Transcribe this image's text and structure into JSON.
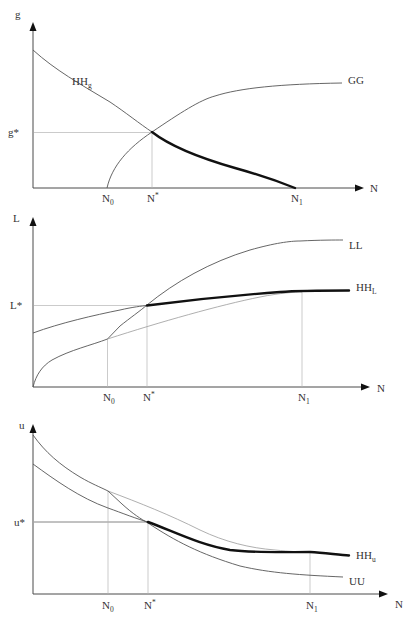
{
  "diagram": {
    "panels": [
      {
        "id": "top",
        "y_axis_label": "g",
        "x_axis_label": "N",
        "equilibrium_label": "g*",
        "curves": [
          {
            "name": "HH_g",
            "label_main": "HH",
            "label_sub": "g",
            "style": "thin then bold after N*"
          },
          {
            "name": "GG",
            "label_main": "GG",
            "label_sub": "",
            "style": "thin"
          }
        ],
        "ticks": [
          {
            "main": "N",
            "sub": "0"
          },
          {
            "main": "N",
            "sup": "*"
          },
          {
            "main": "N",
            "sub": "1"
          }
        ]
      },
      {
        "id": "middle",
        "y_axis_label": "L",
        "x_axis_label": "N",
        "equilibrium_label": "L*",
        "curves": [
          {
            "name": "LL",
            "label_main": "LL",
            "label_sub": "",
            "style": "thin"
          },
          {
            "name": "HH_L",
            "label_main": "HH",
            "label_sub": "L",
            "style": "thin then bold after N*"
          }
        ],
        "ticks": [
          {
            "main": "N",
            "sub": "0"
          },
          {
            "main": "N",
            "sup": "*"
          },
          {
            "main": "N",
            "sub": "1"
          }
        ]
      },
      {
        "id": "bottom",
        "y_axis_label": "u",
        "x_axis_label": "N",
        "equilibrium_label": "u*",
        "curves": [
          {
            "name": "HH_u",
            "label_main": "HH",
            "label_sub": "u",
            "style": "thin then bold after N*"
          },
          {
            "name": "UU",
            "label_main": "UU",
            "label_sub": "",
            "style": "thin"
          }
        ],
        "ticks": [
          {
            "main": "N",
            "sub": "0"
          },
          {
            "main": "N",
            "sup": "*"
          },
          {
            "main": "N",
            "sub": "1"
          }
        ]
      }
    ]
  }
}
